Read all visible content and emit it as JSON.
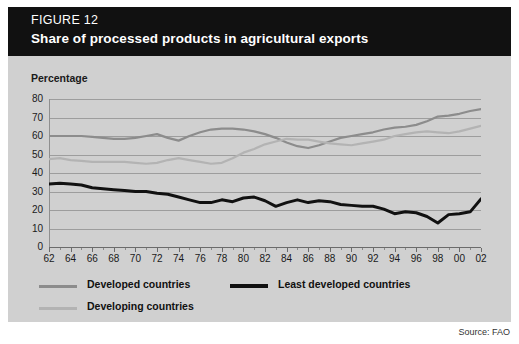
{
  "figure": {
    "number_label": "FIGURE 12",
    "title": "Share of processed products in agricultural exports",
    "source": "Source: FAO",
    "panel_bg": "#d0d0d0",
    "header_bg": "#111111"
  },
  "chart_data": {
    "type": "line",
    "title": "Share of processed products in agricultural exports",
    "xlabel": "",
    "ylabel": "Percentage",
    "ylim": [
      0,
      80
    ],
    "ytick_values": [
      0,
      10,
      20,
      30,
      40,
      50,
      60,
      70,
      80
    ],
    "grid": true,
    "legend_position": "bottom-left",
    "x_tick_labels": [
      "62",
      "64",
      "66",
      "68",
      "70",
      "72",
      "74",
      "76",
      "78",
      "80",
      "82",
      "84",
      "86",
      "88",
      "90",
      "92",
      "94",
      "96",
      "98",
      "00",
      "02"
    ],
    "x": [
      1962,
      1963,
      1964,
      1965,
      1966,
      1967,
      1968,
      1969,
      1970,
      1971,
      1972,
      1973,
      1974,
      1975,
      1976,
      1977,
      1978,
      1979,
      1980,
      1981,
      1982,
      1983,
      1984,
      1985,
      1986,
      1987,
      1988,
      1989,
      1990,
      1991,
      1992,
      1993,
      1994,
      1995,
      1996,
      1997,
      1998,
      1999,
      2000,
      2001,
      2002
    ],
    "xlim": [
      1962,
      2002
    ],
    "series": [
      {
        "name": "Developed countries",
        "color": "#8c8c8c",
        "width": 2.2,
        "values": [
          60,
          60,
          60,
          60,
          59.5,
          59,
          58.5,
          58.5,
          59,
          60,
          61,
          59,
          57.5,
          60,
          62,
          63.5,
          64,
          64,
          63.5,
          62.5,
          61,
          59,
          56.5,
          54.5,
          53.5,
          55,
          57,
          59,
          60,
          61,
          62,
          63.5,
          64.5,
          65,
          66,
          68,
          70.5,
          71,
          72,
          73.5,
          74.5
        ]
      },
      {
        "name": "Developing countries",
        "color": "#b3b3b3",
        "width": 2.2,
        "values": [
          47.5,
          48,
          47,
          46.5,
          46,
          46,
          46,
          46,
          45.5,
          45,
          45.5,
          47,
          48,
          47,
          46,
          45,
          45.5,
          48,
          51,
          53,
          55.5,
          57,
          58.5,
          58,
          58,
          57,
          56,
          55.5,
          55,
          56,
          57,
          58,
          60,
          61,
          62,
          62.5,
          62,
          61.5,
          62.5,
          64,
          65.5
        ]
      },
      {
        "name": "Least developed countries",
        "color": "#111111",
        "width": 3.0,
        "values": [
          34,
          34.5,
          34,
          33.5,
          32,
          31.5,
          31,
          30.5,
          30,
          30,
          29,
          28.5,
          27,
          25.5,
          24,
          24,
          25.5,
          24.5,
          26.5,
          27,
          25,
          22,
          24,
          25.5,
          24,
          25,
          24.5,
          23,
          22.5,
          22,
          22,
          20.5,
          18,
          19,
          18.5,
          16.5,
          13,
          17.5,
          18,
          19,
          26
        ]
      }
    ]
  },
  "legend": {
    "items": [
      {
        "label": "Developed countries",
        "color": "#8c8c8c",
        "thick": false
      },
      {
        "label": "Developing countries",
        "color": "#b3b3b3",
        "thick": false
      },
      {
        "label": "Least developed countries",
        "color": "#111111",
        "thick": true
      }
    ]
  }
}
